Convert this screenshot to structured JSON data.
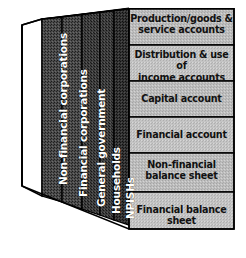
{
  "diagram": {
    "type": "3d-block-matrix",
    "colors": {
      "background": "#ffffff",
      "sector_panel_dark": "#4a4a4a",
      "sector_panel_darker": "#3d3d3d",
      "sector_panel_front": "#2f2f2f",
      "account_panel_light": "#b9b9b9",
      "account_panel_alt": "#c2c2c2",
      "outline": "#000000",
      "side_panel_white": "#ffffff",
      "sector_text": "#ffffff",
      "account_text": "#111111"
    },
    "sectors": {
      "axis_label": "Institutional sectors",
      "items": [
        {
          "label": "Non-financial corporations"
        },
        {
          "label": "Financial corporations"
        },
        {
          "label": "General government"
        },
        {
          "label": "Households"
        },
        {
          "label": "NPISHs"
        }
      ]
    },
    "accounts": {
      "axis_label": "Accounts",
      "items": [
        {
          "lines": [
            "Production/goods &",
            "service accounts"
          ]
        },
        {
          "lines": [
            "Distribution & use of",
            "income accounts"
          ]
        },
        {
          "lines": [
            "Capital account"
          ]
        },
        {
          "lines": [
            "Financial account"
          ]
        },
        {
          "lines": [
            "Non-financial",
            "balance sheet"
          ]
        },
        {
          "lines": [
            "Financial balance sheet"
          ]
        }
      ]
    }
  }
}
